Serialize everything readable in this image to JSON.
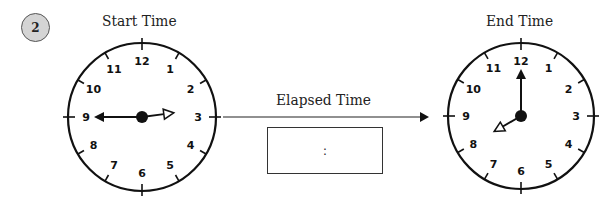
{
  "problem": {
    "number": "2"
  },
  "start_clock": {
    "title": "Start Time",
    "time": "2:45",
    "hour": 2,
    "minute": 45,
    "center": [
      142,
      117
    ],
    "radius": 74,
    "numerals": [
      "12",
      "1",
      "2",
      "3",
      "4",
      "5",
      "6",
      "7",
      "8",
      "9",
      "10",
      "11"
    ]
  },
  "end_clock": {
    "title": "End Time",
    "time": "8:00",
    "hour": 8,
    "minute": 0,
    "center": [
      521,
      116
    ],
    "radius": 73,
    "numerals": [
      "12",
      "1",
      "2",
      "3",
      "4",
      "5",
      "6",
      "7",
      "8",
      "9",
      "10",
      "11"
    ]
  },
  "elapsed": {
    "label": "Elapsed Time",
    "answer_placeholder": ":",
    "answer_value": ""
  },
  "colors": {
    "ink": "#111111",
    "badge_fill": "#d4d4d4"
  }
}
